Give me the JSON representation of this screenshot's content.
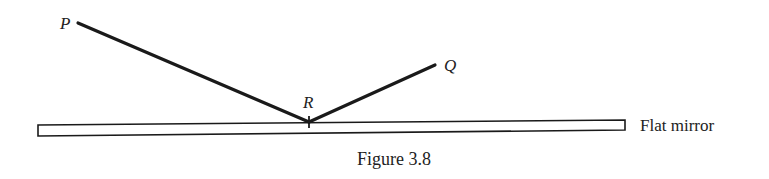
{
  "figure": {
    "caption": "Figure 3.8",
    "colors": {
      "ink": "#1a1a1a",
      "background": "#ffffff"
    },
    "points": {
      "P": {
        "label": "P",
        "x": 78,
        "y": 23
      },
      "Q": {
        "label": "Q",
        "x": 435,
        "y": 65
      },
      "R": {
        "label": "R",
        "x": 309,
        "y": 122
      }
    },
    "mirror": {
      "label": "Flat mirror",
      "left": {
        "x": 38,
        "y_top": 125,
        "y_bottom": 136
      },
      "right": {
        "x": 625,
        "y_top": 120,
        "y_bottom": 130
      }
    },
    "rays": [
      {
        "from": "P",
        "to": "R",
        "name": "incident-ray"
      },
      {
        "from": "R",
        "to": "Q",
        "name": "reflected-ray"
      }
    ]
  }
}
